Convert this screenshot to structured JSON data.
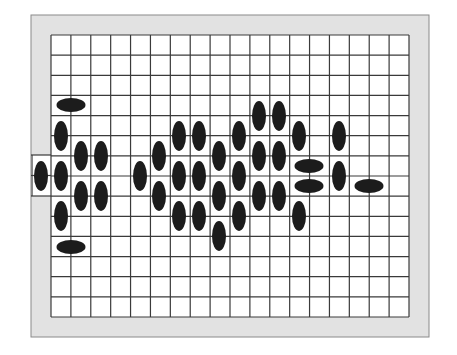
{
  "board": {
    "frame_color": "#e2e2e2",
    "grid_line_color": "#3a3a3a",
    "peg_color": "#1c1c1c",
    "frame": {
      "x": 31,
      "y": 15,
      "w": 398,
      "h": 322
    },
    "grid": {
      "x": 51,
      "y": 35,
      "w": 358,
      "h": 282,
      "cols": 18,
      "rows": 14
    },
    "left_opening": {
      "x": 31,
      "y": 155,
      "w": 20,
      "h": 41
    },
    "pegs": [
      {
        "x": 71,
        "y": 105,
        "o": "h"
      },
      {
        "x": 61,
        "y": 136,
        "o": "v"
      },
      {
        "x": 81,
        "y": 156,
        "o": "v"
      },
      {
        "x": 101,
        "y": 156,
        "o": "v"
      },
      {
        "x": 41,
        "y": 176,
        "o": "v"
      },
      {
        "x": 61,
        "y": 176,
        "o": "v"
      },
      {
        "x": 81,
        "y": 196,
        "o": "v"
      },
      {
        "x": 101,
        "y": 196,
        "o": "v"
      },
      {
        "x": 61,
        "y": 216,
        "o": "v"
      },
      {
        "x": 71,
        "y": 247,
        "o": "h"
      },
      {
        "x": 140,
        "y": 176,
        "o": "v"
      },
      {
        "x": 159,
        "y": 156,
        "o": "v"
      },
      {
        "x": 159,
        "y": 196,
        "o": "v"
      },
      {
        "x": 179,
        "y": 136,
        "o": "v"
      },
      {
        "x": 199,
        "y": 136,
        "o": "v"
      },
      {
        "x": 179,
        "y": 176,
        "o": "v"
      },
      {
        "x": 199,
        "y": 176,
        "o": "v"
      },
      {
        "x": 179,
        "y": 216,
        "o": "v"
      },
      {
        "x": 199,
        "y": 216,
        "o": "v"
      },
      {
        "x": 219,
        "y": 156,
        "o": "v"
      },
      {
        "x": 219,
        "y": 196,
        "o": "v"
      },
      {
        "x": 219,
        "y": 236,
        "o": "v"
      },
      {
        "x": 239,
        "y": 136,
        "o": "v"
      },
      {
        "x": 239,
        "y": 176,
        "o": "v"
      },
      {
        "x": 239,
        "y": 216,
        "o": "v"
      },
      {
        "x": 259,
        "y": 116,
        "o": "v"
      },
      {
        "x": 279,
        "y": 116,
        "o": "v"
      },
      {
        "x": 259,
        "y": 156,
        "o": "v"
      },
      {
        "x": 279,
        "y": 156,
        "o": "v"
      },
      {
        "x": 259,
        "y": 196,
        "o": "v"
      },
      {
        "x": 279,
        "y": 196,
        "o": "v"
      },
      {
        "x": 299,
        "y": 136,
        "o": "v"
      },
      {
        "x": 309,
        "y": 166,
        "o": "h"
      },
      {
        "x": 309,
        "y": 186,
        "o": "h"
      },
      {
        "x": 299,
        "y": 216,
        "o": "v"
      },
      {
        "x": 339,
        "y": 136,
        "o": "v"
      },
      {
        "x": 339,
        "y": 176,
        "o": "v"
      },
      {
        "x": 369,
        "y": 186,
        "o": "h"
      }
    ]
  }
}
